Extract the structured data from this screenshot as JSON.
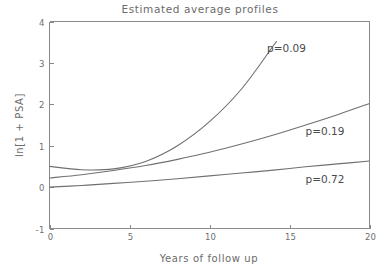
{
  "chart_data": {
    "type": "line",
    "title": "Estimated average profiles",
    "xlabel": "Years of follow up",
    "ylabel": "ln[1 + PSA]",
    "xlim": [
      0,
      20
    ],
    "ylim": [
      -1,
      4
    ],
    "xticks": [
      "0",
      "5",
      "10",
      "15",
      "20"
    ],
    "xtick_values": [
      0,
      5,
      10,
      15,
      20
    ],
    "yticks": [
      "-1",
      "0",
      "1",
      "2",
      "3",
      "4"
    ],
    "ytick_values": [
      -1,
      0,
      1,
      2,
      3,
      4
    ],
    "grid": false,
    "legend_position": "inline-annotations",
    "x": [
      0,
      2,
      4,
      6,
      8,
      10,
      12,
      14,
      16,
      18,
      20
    ],
    "series": [
      {
        "name": "p=0.09",
        "label": "p=0.09",
        "values": [
          0.5,
          0.42,
          0.44,
          0.62,
          1.0,
          1.58,
          2.37,
          3.42,
          null,
          null,
          null
        ],
        "annotation": "p=0.09",
        "annotation_x": 13.6,
        "annotation_y": 3.35,
        "exits_top_at_x": 14.1
      },
      {
        "name": "p=0.19",
        "label": "p=0.19",
        "values": [
          0.22,
          0.3,
          0.4,
          0.52,
          0.67,
          0.84,
          1.04,
          1.26,
          1.5,
          1.75,
          2.02
        ],
        "annotation": "p=0.19",
        "annotation_x": 16.0,
        "annotation_y": 1.35
      },
      {
        "name": "p=0.72",
        "label": "p=0.72",
        "values": [
          0.0,
          0.04,
          0.09,
          0.14,
          0.2,
          0.27,
          0.34,
          0.41,
          0.49,
          0.56,
          0.63
        ],
        "annotation": "p=0.72",
        "annotation_x": 16.0,
        "annotation_y": 0.18
      }
    ],
    "colors": {
      "curve": "#707070",
      "axis": "#8a8a8a",
      "text": "#6b6b6b",
      "annotation": "#4a4a4a",
      "background": "#ffffff"
    }
  }
}
